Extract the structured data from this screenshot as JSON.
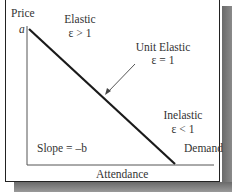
{
  "diagram": {
    "y_axis_label": "Price",
    "x_axis_label": "Attendance",
    "intercept_label": "a",
    "curve_label": "Demand",
    "slope_label": "Slope = –b",
    "regions": {
      "elastic": {
        "title": "Elastic",
        "condition": "ε > 1"
      },
      "unit_elastic": {
        "title": "Unit Elastic",
        "condition": "ε = 1"
      },
      "inelastic": {
        "title": "Inelastic",
        "condition": "ε < 1"
      }
    },
    "colors": {
      "line": "#1a1a1a",
      "text": "#333333",
      "shadow": "#6a6a6a",
      "arrow": "#555555"
    }
  }
}
